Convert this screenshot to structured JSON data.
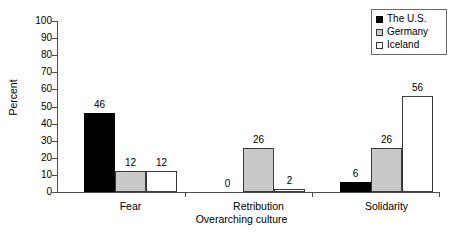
{
  "chart_data": {
    "type": "bar",
    "title": "",
    "xlabel": "Overarching culture",
    "ylabel": "Percent",
    "categories": [
      "Fear",
      "Retribution",
      "Solidarity"
    ],
    "series": [
      {
        "name": "The U.S.",
        "color": "#000000",
        "values": [
          46,
          0,
          6
        ]
      },
      {
        "name": "Germany",
        "color": "#c9c9c9",
        "values": [
          12,
          26,
          26
        ]
      },
      {
        "name": "Iceland",
        "color": "#ffffff",
        "values": [
          12,
          2,
          56
        ]
      }
    ],
    "ylim": [
      0,
      100
    ],
    "yticks": [
      0,
      10,
      20,
      30,
      40,
      50,
      60,
      70,
      80,
      90,
      100
    ],
    "ytick_labels": [
      "0",
      "10",
      "20",
      "30",
      "40",
      "50",
      "60",
      "70",
      "80",
      "90",
      "100"
    ],
    "grid": false,
    "legend_position": "top-right",
    "data_labels": true
  },
  "axis": {
    "y_title": "Percent",
    "x_title": "Overarching culture"
  },
  "legend": {
    "items": [
      {
        "label": "The U.S."
      },
      {
        "label": "Germany"
      },
      {
        "label": "Iceland"
      }
    ]
  }
}
